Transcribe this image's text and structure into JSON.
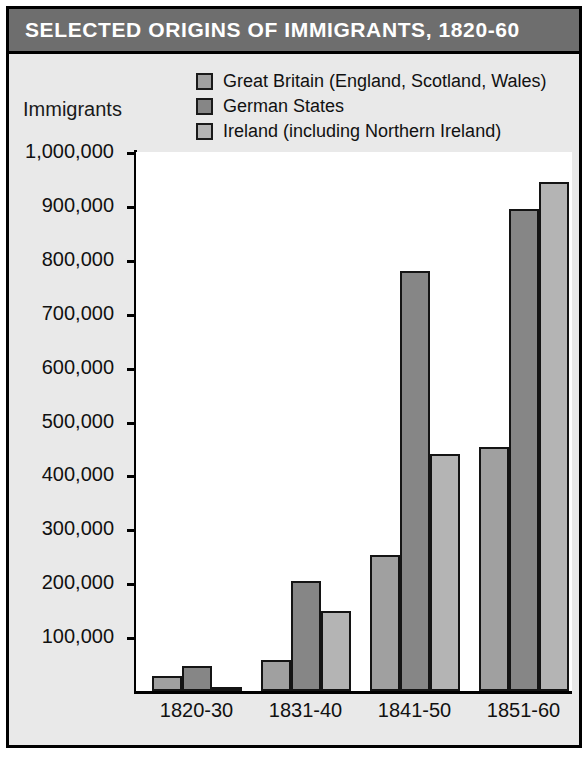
{
  "title": "SELECTED ORIGINS OF IMMIGRANTS, 1820-60",
  "axis_title": "Immigrants",
  "colors": {
    "title_bar": "#6e6e6e",
    "panel": "#e9e9e9",
    "plot": "#ffffff",
    "frame": "#000000",
    "great_britain": "#a0a0a0",
    "german_states": "#868686",
    "ireland": "#b4b4b4"
  },
  "legend": [
    {
      "label": "Great Britain (England, Scotland, Wales)",
      "swatch": "#a0a0a0"
    },
    {
      "label": "German States",
      "swatch": "#868686"
    },
    {
      "label": "Ireland (including Northern Ireland)",
      "swatch": "#b4b4b4"
    }
  ],
  "y_ticks": [
    "1,000,000",
    "900,000",
    "800,000",
    "700,000",
    "600,000",
    "500,000",
    "400,000",
    "300,000",
    "200,000",
    "100,000"
  ],
  "chart_data": {
    "type": "bar",
    "title": "SELECTED ORIGINS OF IMMIGRANTS, 1820-60",
    "xlabel": "",
    "ylabel": "Immigrants",
    "ylim": [
      0,
      1000000
    ],
    "ytick_values": [
      100000,
      200000,
      300000,
      400000,
      500000,
      600000,
      700000,
      800000,
      900000,
      1000000
    ],
    "grid": false,
    "legend_position": "top",
    "categories": [
      "1820-30",
      "1831-40",
      "1841-50",
      "1851-60"
    ],
    "series": [
      {
        "name": "Great Britain (England, Scotland, Wales)",
        "color": "#a0a0a0",
        "values": [
          27000,
          58000,
          253000,
          452000
        ]
      },
      {
        "name": "German States",
        "color": "#868686",
        "values": [
          46000,
          205000,
          780000,
          895000
        ]
      },
      {
        "name": "Ireland (including Northern Ireland)",
        "color": "#b4b4b4",
        "values": [
          8000,
          148000,
          440000,
          945000
        ]
      }
    ]
  }
}
